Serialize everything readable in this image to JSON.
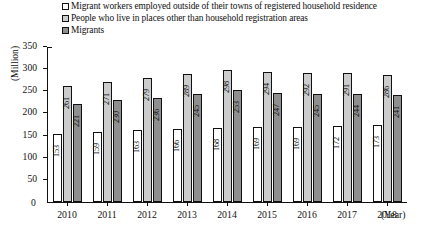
{
  "legend": {
    "items": [
      {
        "marker": "white-square-icon",
        "label": "Migrant workers employed outside of their towns of registered household residence"
      },
      {
        "marker": "light-gray-square-icon",
        "label": "People who live in places other than household registration areas"
      },
      {
        "marker": "dark-gray-square-icon",
        "label": "Migrants"
      }
    ]
  },
  "axes": {
    "ylabel": "(Million)",
    "xunit": "(Year)",
    "yticks": [
      "350",
      "300",
      "250",
      "200",
      "150",
      "100",
      "50",
      "0"
    ]
  },
  "colors": {
    "series1": "#ffffff",
    "series2": "#cccccc",
    "series3": "#8f8f8f",
    "outline": "#111111"
  },
  "chart_data": {
    "type": "bar",
    "title": "",
    "xlabel": "(Year)",
    "ylabel": "(Million)",
    "ylim": [
      0,
      350
    ],
    "ytick_step": 50,
    "grid": false,
    "legend_position": "top",
    "categories": [
      "2010",
      "2011",
      "2012",
      "2013",
      "2014",
      "2015",
      "2016",
      "2017",
      "2018"
    ],
    "series": [
      {
        "name": "Migrant workers employed outside of their towns of registered household residence",
        "values": [
          153,
          159,
          163,
          166,
          168,
          169,
          169,
          172,
          173
        ]
      },
      {
        "name": "People who live in places other than household registration areas",
        "values": [
          261,
          271,
          279,
          289,
          298,
          294,
          292,
          291,
          286
        ]
      },
      {
        "name": "Migrants",
        "values": [
          221,
          230,
          236,
          245,
          253,
          247,
          245,
          244,
          241
        ]
      }
    ]
  }
}
